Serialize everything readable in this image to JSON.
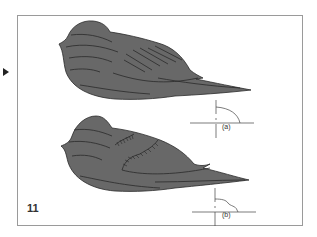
{
  "figure": {
    "number": "11",
    "marker_icon": "play-triangle-icon",
    "fill_color": "#686868",
    "stroke_color": "#2a2a2a",
    "frame_color": "#9a9a9a",
    "diagrams": [
      {
        "id": "a",
        "label": "(a)",
        "description": "bird shape with diagonal wing feather lines"
      },
      {
        "id": "b",
        "label": "(b)",
        "description": "bird shape with hatched wing coverts"
      }
    ]
  }
}
